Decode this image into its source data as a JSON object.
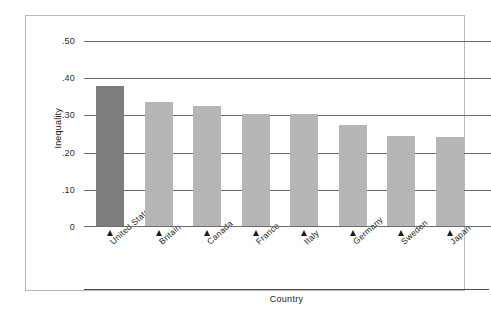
{
  "chart_data": {
    "type": "bar",
    "title": "",
    "xlabel": "Country",
    "ylabel": "Inequality",
    "categories": [
      "United States",
      "Britain",
      "Canada",
      "France",
      "Italy",
      "Germany",
      "Sweden",
      "Japan"
    ],
    "values": [
      0.38,
      0.335,
      0.325,
      0.305,
      0.305,
      0.275,
      0.245,
      0.243
    ],
    "ylim": [
      0,
      0.5
    ],
    "ytick_values": [
      0.5,
      0.4,
      0.3,
      0.2,
      0.1,
      0
    ],
    "ytick_labels": [
      ".50",
      ".40",
      ".30",
      ".20",
      ".10",
      "0"
    ],
    "grid": true,
    "legend": "none",
    "highlight_category": "United States",
    "colors": {
      "bar": "#b6b6b6",
      "bar_highlight": "#7d7d7d",
      "gridline": "#6d6d6d",
      "frame": "#b9b9b9",
      "text": "#1d1d1d",
      "background": "#ffffff"
    }
  }
}
